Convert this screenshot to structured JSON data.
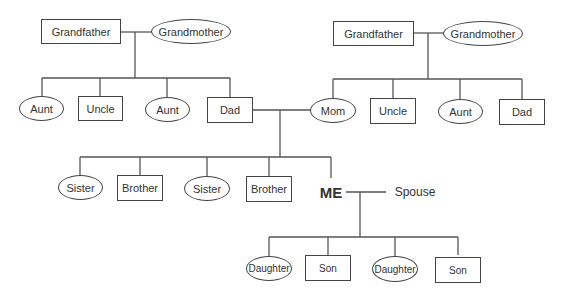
{
  "diagram": {
    "paternal": {
      "grandfather": "Grandfather",
      "grandmother": "Grandmother",
      "children": [
        "Aunt",
        "Uncle",
        "Aunt",
        "Dad"
      ]
    },
    "maternal": {
      "grandfather": "Grandfather",
      "grandmother": "Grandmother",
      "children": [
        "Mom",
        "Uncle",
        "Aunt",
        "Dad"
      ]
    },
    "siblings": [
      "Sister",
      "Brother",
      "Sister",
      "Brother"
    ],
    "me": "ME",
    "spouse": "Spouse",
    "children": [
      "Daughter",
      "Son",
      "Daughter",
      "Son"
    ],
    "legend": {
      "box": "male",
      "oval": "female"
    }
  }
}
